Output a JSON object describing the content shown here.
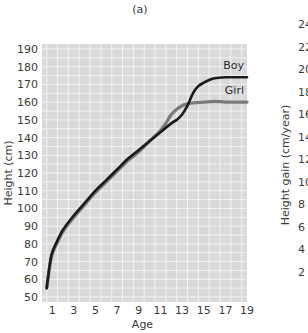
{
  "chart_data": [
    {
      "type": "line",
      "title": "(a)",
      "xlabel": "Age",
      "ylabel": "Height (cm)",
      "xlim": [
        0,
        19.5
      ],
      "ylim": [
        45,
        190
      ],
      "xticks": [
        1,
        3,
        5,
        7,
        9,
        11,
        13,
        15,
        17,
        19
      ],
      "yticks": [
        50,
        60,
        70,
        80,
        90,
        100,
        110,
        120,
        130,
        140,
        150,
        160,
        170,
        180,
        190
      ],
      "grid": true,
      "background": "#d9d9d9",
      "series": [
        {
          "name": "Girl",
          "color": "#7a7a7a",
          "x": [
            0.5,
            0.75,
            1,
            1.5,
            2,
            3,
            4,
            5,
            6,
            7,
            8,
            9,
            10,
            11,
            11.5,
            12,
            12.5,
            13,
            13.5,
            14,
            15,
            16,
            17,
            18,
            19.5
          ],
          "values": [
            55,
            66,
            74,
            81,
            87,
            95,
            102,
            109,
            115,
            121,
            127,
            132,
            138,
            144,
            148,
            153,
            156,
            158,
            159,
            159.5,
            160,
            160.5,
            160,
            160,
            160
          ]
        },
        {
          "name": "Boy",
          "color": "#1a1a1a",
          "x": [
            0.5,
            0.75,
            1,
            1.5,
            2,
            3,
            4,
            5,
            6,
            7,
            8,
            9,
            10,
            11,
            12,
            12.5,
            13,
            13.5,
            14,
            14.5,
            15,
            15.5,
            16,
            17,
            18,
            19.5
          ],
          "values": [
            55,
            67,
            75,
            82,
            88,
            96,
            103,
            110,
            116,
            122,
            128,
            133,
            138,
            143,
            148,
            150,
            153,
            158,
            165,
            169,
            171,
            172.5,
            173.5,
            174,
            174,
            174
          ]
        }
      ]
    },
    {
      "type": "line",
      "partial": true,
      "ylabel": "Height gain (cm/year)",
      "yticks": [
        2,
        4,
        6,
        8,
        10,
        12,
        14,
        16,
        18,
        20,
        22,
        24
      ],
      "visible_tick_labels": [
        "24",
        "22",
        "20",
        "18",
        "16",
        "14",
        "12",
        "10",
        "8",
        "6",
        "4",
        "2"
      ]
    }
  ]
}
